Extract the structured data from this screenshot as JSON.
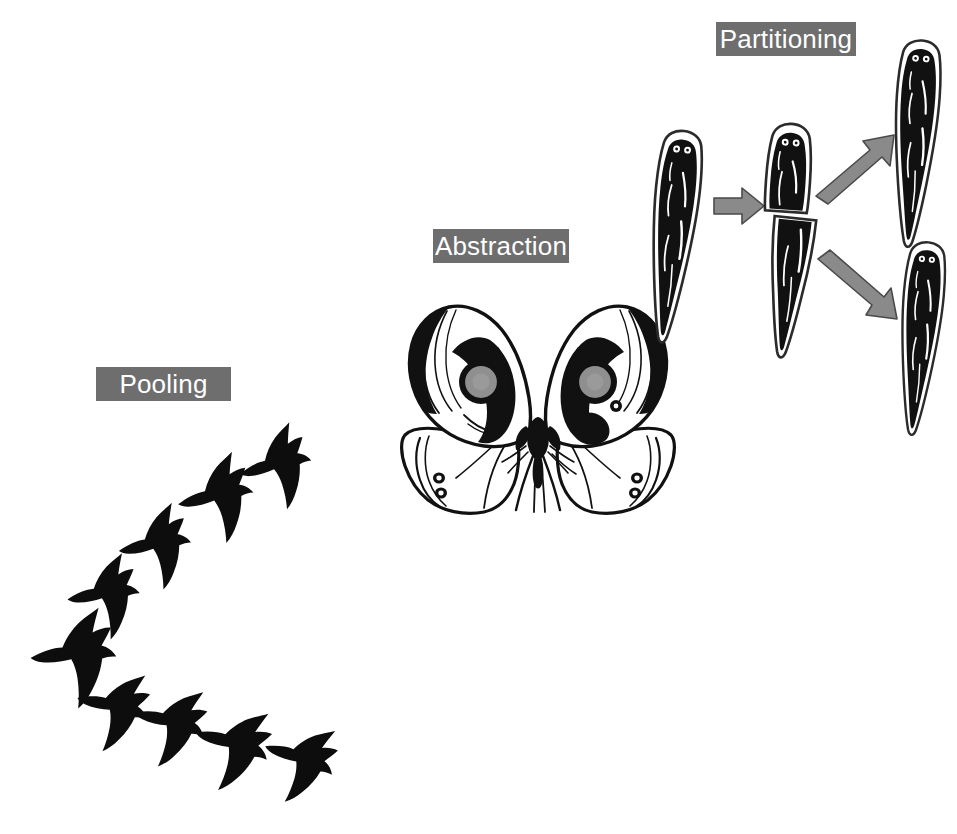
{
  "figure": {
    "background_color": "#ffffff",
    "width": 957,
    "height": 834,
    "kind": "scientific-concept-diagram",
    "panel_count": 3
  },
  "labels": {
    "style": {
      "background_color": "#6e6e6e",
      "text_color": "#ffffff",
      "font_size_px": 26
    },
    "pooling": "Pooling",
    "abstraction": "Abstraction",
    "partitioning": "Partitioning"
  },
  "panels": [
    {
      "id": "pooling",
      "label": "Pooling",
      "subject": "flock of birds in V formation",
      "silhouette_color": "#0d0d0d",
      "bird_count": 9,
      "formation": "V / chevron pointing left",
      "birds": [
        {
          "index": 1,
          "arm": "apex",
          "cx": 84,
          "cy": 648,
          "scale": 1.18,
          "rot": -8
        },
        {
          "index": 2,
          "arm": "upper",
          "cx": 112,
          "cy": 588,
          "scale": 1.0,
          "rot": -12
        },
        {
          "index": 3,
          "arm": "upper",
          "cx": 163,
          "cy": 538,
          "scale": 1.0,
          "rot": -14
        },
        {
          "index": 4,
          "arm": "upper",
          "cx": 224,
          "cy": 489,
          "scale": 1.05,
          "rot": -16
        },
        {
          "index": 5,
          "arm": "upper",
          "cx": 283,
          "cy": 458,
          "scale": 1.0,
          "rot": -18
        },
        {
          "index": 6,
          "arm": "lower",
          "cx": 123,
          "cy": 704,
          "scale": 1.0,
          "rot": 10
        },
        {
          "index": 7,
          "arm": "lower",
          "cx": 180,
          "cy": 720,
          "scale": 1.0,
          "rot": 12
        },
        {
          "index": 8,
          "arm": "lower",
          "cx": 243,
          "cy": 742,
          "scale": 1.05,
          "rot": 14
        },
        {
          "index": 9,
          "arm": "lower",
          "cx": 310,
          "cy": 757,
          "scale": 1.0,
          "rot": 16
        }
      ]
    },
    {
      "id": "abstraction",
      "label": "Abstraction",
      "subject": "owl butterfly with wing eyespots",
      "line_color": "#111111",
      "fill_color": "#ffffff",
      "eyespot_fill": "#8f8f8f",
      "eyespot_ring": "#111111",
      "eyespot_count": 2,
      "wing_pairs": 2
    },
    {
      "id": "partitioning",
      "label": "Partitioning",
      "subject": "planarian flatworm regeneration after bisection",
      "body_color": "#111111",
      "outline_color": "#2b2b2b",
      "arrow_fill": "#8a8a8a",
      "arrow_stroke": "#4a4a4a",
      "stages": [
        {
          "stage": 1,
          "name": "intact worm",
          "count": 1
        },
        {
          "stage": 2,
          "name": "bisected worm (head fragment + tail fragment)",
          "count": 2
        },
        {
          "stage": 3,
          "name": "two regenerated worms",
          "count": 2
        }
      ],
      "arrows": [
        {
          "id": "arrow-split",
          "direction": "right",
          "from": "intact worm",
          "to": "bisected worm"
        },
        {
          "id": "arrow-upper",
          "direction": "up-right",
          "from": "head fragment",
          "to": "regenerated worm top"
        },
        {
          "id": "arrow-lower",
          "direction": "down-right",
          "from": "tail fragment",
          "to": "regenerated worm bottom"
        }
      ]
    }
  ]
}
